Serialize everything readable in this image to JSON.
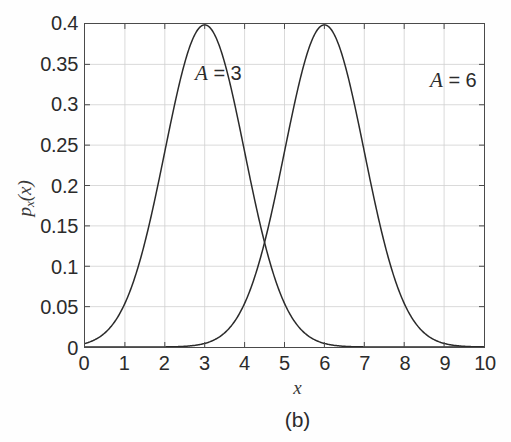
{
  "figure": {
    "caption": "(b)",
    "background_color": "#fefefe",
    "axes_color": "#4a4a4a",
    "grid_color": "#d0d0d0",
    "curve_color": "#2b2b2b"
  },
  "axis": {
    "xlabel": "x",
    "ylabel_main": "p",
    "ylabel_sub": "x",
    "ylabel_arg": "(x)",
    "xticks": [
      "0",
      "1",
      "2",
      "3",
      "4",
      "5",
      "6",
      "7",
      "8",
      "9",
      "10"
    ],
    "yticks": [
      "0",
      "0.05",
      "0.1",
      "0.15",
      "0.2",
      "0.25",
      "0.3",
      "0.35",
      "0.4"
    ]
  },
  "annotations": [
    {
      "name": "curve-label-a3",
      "var": "A",
      "eq": " = 3"
    },
    {
      "name": "curve-label-a6",
      "var": "A",
      "eq": " = 6"
    }
  ],
  "chart_data": {
    "type": "line",
    "title": "",
    "subtitle": "(b)",
    "xlabel": "x",
    "ylabel": "p_x(x)",
    "xlim": [
      0,
      10
    ],
    "ylim": [
      0,
      0.4
    ],
    "xticks": [
      0,
      1,
      2,
      3,
      4,
      5,
      6,
      7,
      8,
      9,
      10
    ],
    "yticks": [
      0,
      0.05,
      0.1,
      0.15,
      0.2,
      0.25,
      0.3,
      0.35,
      0.4
    ],
    "grid": true,
    "legend": "none",
    "annotations": [
      {
        "text": "A = 3",
        "x": 1.3,
        "y": 0.385
      },
      {
        "text": "A = 6",
        "x": 7.1,
        "y": 0.377
      }
    ],
    "series": [
      {
        "name": "A = 3",
        "distribution": "gaussian",
        "mean": 3,
        "sigma": 1,
        "peak": 0.3989,
        "x": [
          0,
          0.25,
          0.5,
          0.75,
          1,
          1.25,
          1.5,
          1.75,
          2,
          2.25,
          2.5,
          2.75,
          3,
          3.25,
          3.5,
          3.75,
          4,
          4.25,
          4.5,
          4.75,
          5,
          5.25,
          5.5,
          5.75,
          6,
          6.5,
          7,
          7.5,
          8,
          8.5,
          9,
          9.5,
          10
        ],
        "values": [
          0.0044,
          0.0088,
          0.0175,
          0.0325,
          0.054,
          0.0863,
          0.1295,
          0.1826,
          0.242,
          0.3011,
          0.3521,
          0.3867,
          0.3989,
          0.3867,
          0.3521,
          0.3011,
          0.242,
          0.1826,
          0.1295,
          0.0863,
          0.054,
          0.0325,
          0.0175,
          0.0088,
          0.0044,
          0.0009,
          0.0001,
          0.0,
          0.0,
          0.0,
          0.0,
          0.0,
          0.0
        ]
      },
      {
        "name": "A = 6",
        "distribution": "gaussian",
        "mean": 6,
        "sigma": 1,
        "peak": 0.3989,
        "x": [
          0,
          1,
          1.5,
          2,
          2.5,
          3,
          3.25,
          3.5,
          3.75,
          4,
          4.25,
          4.5,
          4.75,
          5,
          5.25,
          5.5,
          5.75,
          6,
          6.25,
          6.5,
          6.75,
          7,
          7.25,
          7.5,
          7.75,
          8,
          8.25,
          8.5,
          8.75,
          9,
          9.5,
          10
        ],
        "values": [
          0.0,
          0.0,
          0.0001,
          0.0001,
          0.0009,
          0.0044,
          0.0088,
          0.0175,
          0.0325,
          0.054,
          0.0863,
          0.1295,
          0.1826,
          0.242,
          0.3011,
          0.3521,
          0.3867,
          0.3989,
          0.3867,
          0.3521,
          0.3011,
          0.242,
          0.1826,
          0.1295,
          0.0863,
          0.054,
          0.0325,
          0.0175,
          0.0088,
          0.0044,
          0.0009,
          0.0001
        ]
      }
    ],
    "intersection": {
      "x": 4.5,
      "y": 0.1295
    }
  }
}
